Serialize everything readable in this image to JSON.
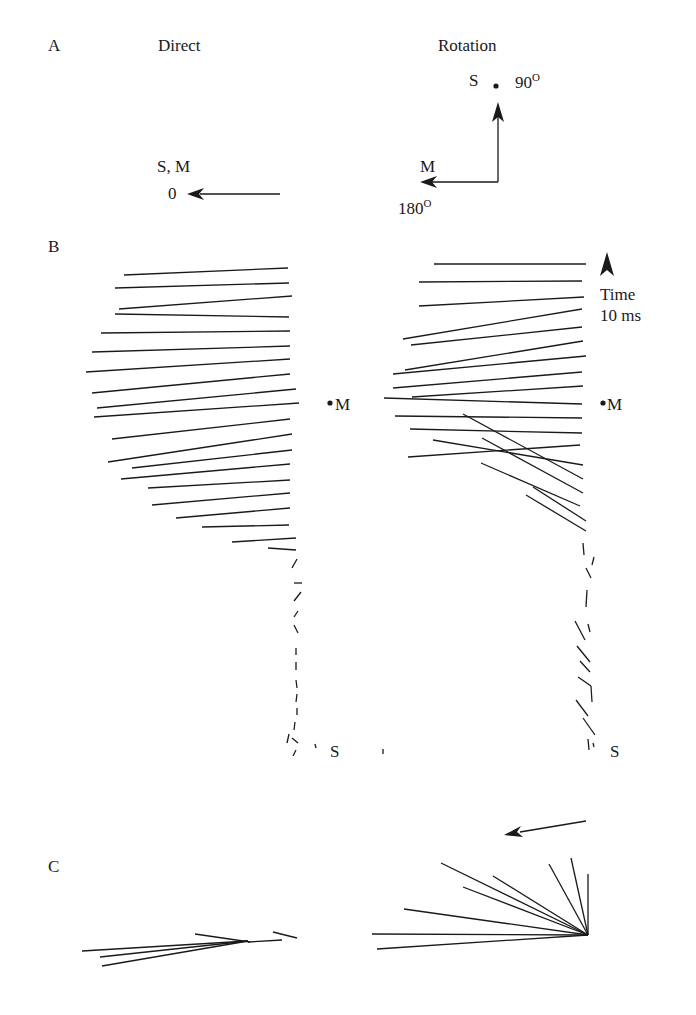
{
  "panels": {
    "A": {
      "label": "A",
      "direct": {
        "title": "Direct",
        "target_label": "S, M",
        "angle_label": "0"
      },
      "rotation": {
        "title": "Rotation",
        "s_label": "S",
        "s_angle": "90",
        "m_label": "M",
        "m_angle": "180",
        "degree_mark": "O"
      }
    },
    "B": {
      "label": "B",
      "time_label": "Time",
      "time_value": "10 ms",
      "m_label": "M",
      "s_label": "S"
    },
    "C": {
      "label": "C"
    }
  },
  "colors": {
    "ink": "#1a1a1a",
    "background": "#ffffff"
  }
}
